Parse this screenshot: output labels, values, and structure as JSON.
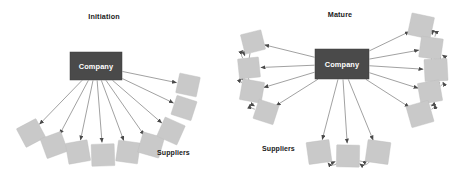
{
  "figure": {
    "background": "#ffffff",
    "supplier_color": "#c9c9c9",
    "company_color": "#4a4a4a",
    "line_color": "#6e6e6e"
  },
  "panels": [
    {
      "id": "initiation",
      "title": "Initiation",
      "hub_label": "Company",
      "role_label": "Suppliers",
      "hub": {
        "x": 96,
        "y": 66,
        "w": 52,
        "h": 28
      },
      "role_label_pos": {
        "x": 157,
        "y": 155
      },
      "title_pos": {
        "x": 104,
        "y": 19
      },
      "supplier_count": 9,
      "suppliers": [
        {
          "x": 31,
          "y": 133,
          "w": 22,
          "h": 21,
          "rot": -28
        },
        {
          "x": 54,
          "y": 145,
          "w": 22,
          "h": 21,
          "rot": -20
        },
        {
          "x": 78,
          "y": 152,
          "w": 22,
          "h": 21,
          "rot": -10
        },
        {
          "x": 103,
          "y": 155,
          "w": 23,
          "h": 22,
          "rot": -2
        },
        {
          "x": 128,
          "y": 152,
          "w": 22,
          "h": 21,
          "rot": 8
        },
        {
          "x": 151,
          "y": 145,
          "w": 22,
          "h": 21,
          "rot": 16
        },
        {
          "x": 171,
          "y": 131,
          "w": 22,
          "h": 21,
          "rot": 24
        },
        {
          "x": 184,
          "y": 108,
          "w": 21,
          "h": 20,
          "rot": 18
        },
        {
          "x": 188,
          "y": 85,
          "w": 21,
          "h": 20,
          "rot": 12
        }
      ],
      "edges_from_hub_to_all_suppliers": true,
      "supplier_to_supplier_links": 0
    },
    {
      "id": "mature",
      "title": "Mature",
      "hub_label": "Company",
      "role_label": "Suppliers",
      "hub": {
        "x": 342,
        "y": 64,
        "w": 54,
        "h": 30
      },
      "role_label_pos": {
        "x": 262,
        "y": 151
      },
      "title_pos": {
        "x": 340,
        "y": 17
      },
      "supplier_count": 12,
      "clusters": {
        "left": {
          "count": 4
        },
        "right": {
          "count": 5
        },
        "bottom": {
          "count": 3
        }
      },
      "suppliers": [
        {
          "x": 253,
          "y": 42,
          "w": 21,
          "h": 20,
          "rot": -14,
          "group": "left"
        },
        {
          "x": 249,
          "y": 68,
          "w": 21,
          "h": 20,
          "rot": -6,
          "group": "left"
        },
        {
          "x": 252,
          "y": 91,
          "w": 22,
          "h": 21,
          "rot": 10,
          "group": "left"
        },
        {
          "x": 266,
          "y": 112,
          "w": 21,
          "h": 20,
          "rot": 18,
          "group": "left"
        },
        {
          "x": 421,
          "y": 26,
          "w": 23,
          "h": 22,
          "rot": 12,
          "group": "right"
        },
        {
          "x": 431,
          "y": 48,
          "w": 22,
          "h": 21,
          "rot": 8,
          "group": "right"
        },
        {
          "x": 436,
          "y": 70,
          "w": 23,
          "h": 22,
          "rot": -3,
          "group": "right"
        },
        {
          "x": 430,
          "y": 92,
          "w": 22,
          "h": 21,
          "rot": -10,
          "group": "right"
        },
        {
          "x": 420,
          "y": 114,
          "w": 23,
          "h": 22,
          "rot": -16,
          "group": "right"
        },
        {
          "x": 319,
          "y": 152,
          "w": 23,
          "h": 22,
          "rot": -8,
          "group": "bottom"
        },
        {
          "x": 348,
          "y": 156,
          "w": 23,
          "h": 22,
          "rot": 1,
          "group": "bottom"
        },
        {
          "x": 378,
          "y": 152,
          "w": 23,
          "h": 22,
          "rot": 8,
          "group": "bottom"
        }
      ],
      "edges_from_hub_to_all_suppliers": true,
      "supplier_to_supplier_links": 12
    }
  ]
}
